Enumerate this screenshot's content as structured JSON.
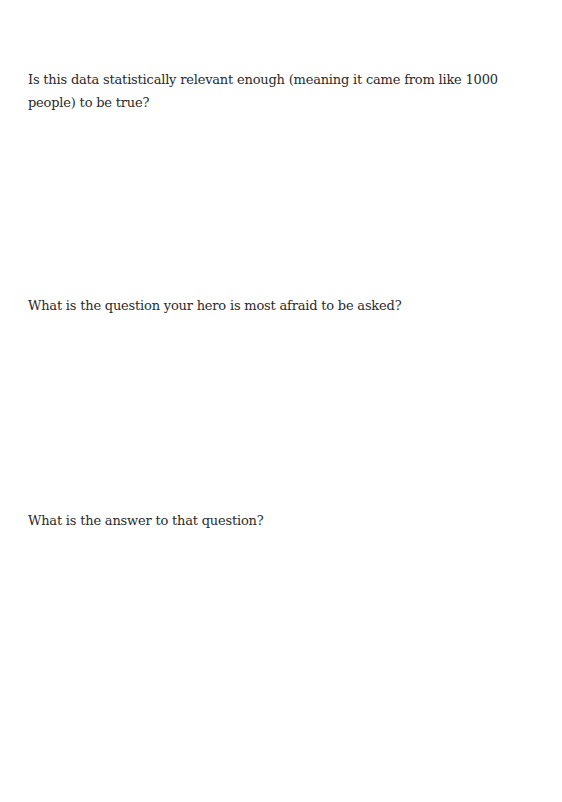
{
  "document": {
    "questions": [
      {
        "text": "Is this data statistically relevant enough (meaning it came from like 1000 people) to be true?"
      },
      {
        "text": "What is the question your hero is most afraid to be asked?"
      },
      {
        "text": "What is the answer to that question?"
      }
    ]
  }
}
